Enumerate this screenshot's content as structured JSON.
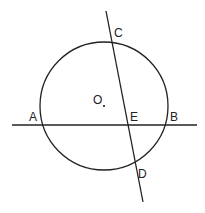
{
  "diagram": {
    "type": "geometry",
    "circle": {
      "center_label": "O",
      "cx": 104,
      "cy": 106,
      "r": 64
    },
    "points": {
      "A": {
        "label": "A",
        "x": 40,
        "y": 125
      },
      "B": {
        "label": "B",
        "x": 167,
        "y": 125
      },
      "C": {
        "label": "C",
        "x": 111,
        "y": 41
      },
      "D": {
        "label": "D",
        "x": 137,
        "y": 166
      },
      "E": {
        "label": "E",
        "x": 129,
        "y": 125
      },
      "O": {
        "label": "O",
        "x": 104,
        "y": 106
      }
    },
    "lines": [
      {
        "name": "line-AB",
        "x1": 12,
        "y1": 125,
        "x2": 197,
        "y2": 125
      },
      {
        "name": "line-CD",
        "x1": 106,
        "y1": 11,
        "x2": 143,
        "y2": 202
      }
    ],
    "colors": {
      "stroke": "#222222",
      "background": "#ffffff"
    }
  }
}
